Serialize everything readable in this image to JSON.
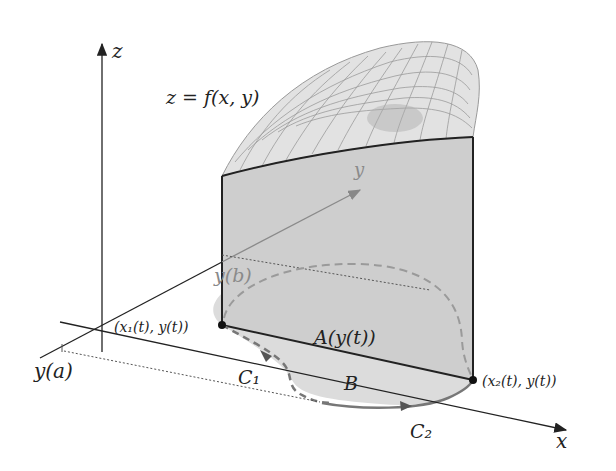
{
  "diagram": {
    "labels": {
      "z_axis": "z",
      "x_axis": "x",
      "y_axis": "y",
      "surface": "z = f(x, y)",
      "y_b": "y(b)",
      "y_a": "y(a)",
      "point_left": "(x₁(t), y(t))",
      "point_right": "(x₂(t), y(t))",
      "area": "A(y(t))",
      "region": "B",
      "curve_1": "C₁",
      "curve_2": "C₂"
    },
    "colors": {
      "panel_fill": "#cfcfcf",
      "region_fill": "#d9d9d9",
      "mesh": "#8c8c8c",
      "axis": "#222222",
      "curve": "#777777"
    }
  }
}
